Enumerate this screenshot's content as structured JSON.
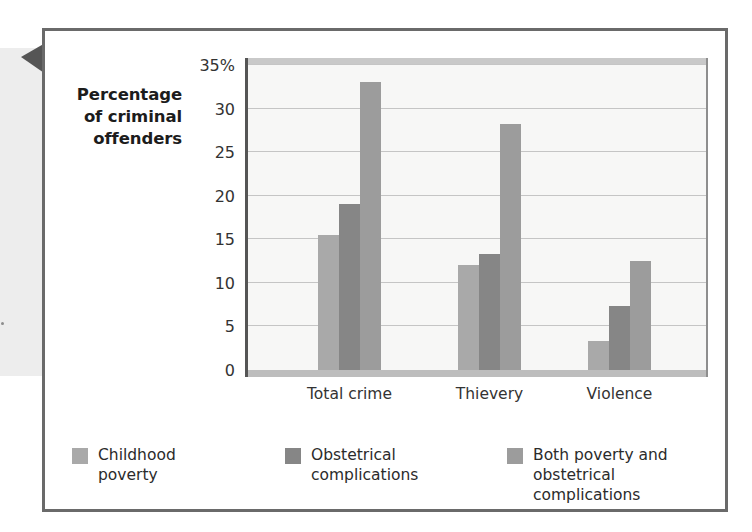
{
  "figure": {
    "callout_arrow_icon": "left-pointer-triangle",
    "border_color": "#6a6a6a"
  },
  "chart_data": {
    "type": "bar",
    "title": "",
    "xlabel": "",
    "ylabel": "Percentage of criminal offenders",
    "ylabel_lines": [
      "Percentage",
      "of criminal",
      "offenders"
    ],
    "categories": [
      "Total crime",
      "Thievery",
      "Violence"
    ],
    "series": [
      {
        "name": "Childhood poverty",
        "values": [
          15.5,
          12.0,
          3.3
        ],
        "color": "#a9a9a9"
      },
      {
        "name": "Obstetrical complications",
        "values": [
          19.0,
          13.3,
          7.3
        ],
        "color": "#868686"
      },
      {
        "name": "Both poverty and obstetrical complications",
        "values": [
          33.0,
          28.2,
          12.5
        ],
        "color": "#9c9c9c"
      }
    ],
    "ylim": [
      0,
      35
    ],
    "yticks": [
      0,
      5,
      10,
      15,
      20,
      25,
      30,
      35
    ],
    "ytick_labels": [
      "0",
      "5",
      "10",
      "15",
      "20",
      "25",
      "30",
      "35%"
    ],
    "grid": true,
    "legend_position": "bottom",
    "plot_background": "#f7f7f6",
    "gridline_color": "#c5c5c5"
  },
  "legend": [
    {
      "label": "Childhood\npoverty",
      "color": "#a9a9a9"
    },
    {
      "label": "Obstetrical\ncomplications",
      "color": "#868686"
    },
    {
      "label": "Both poverty and\nobstetrical complications",
      "color": "#9c9c9c"
    }
  ]
}
